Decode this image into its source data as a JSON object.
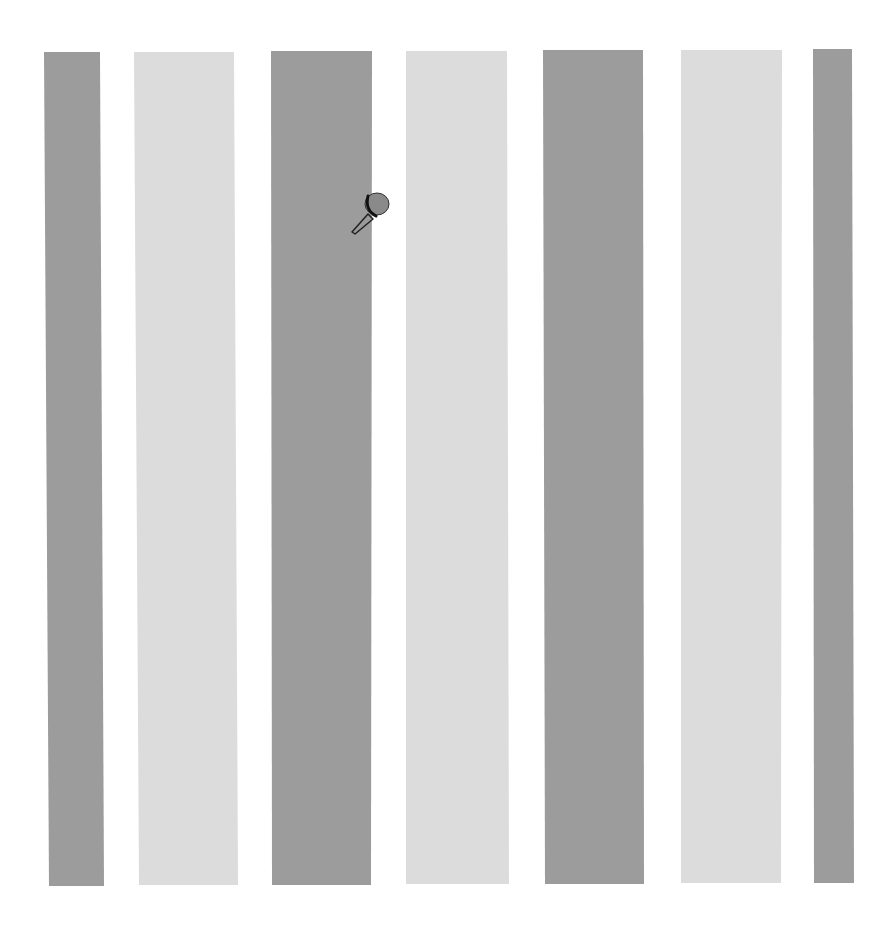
{
  "scene": {
    "description": "Vertical alternating gray stripes on white background with a small pushpin",
    "background": "#ffffff",
    "colors": {
      "dark": "#9c9c9c",
      "light": "#dcdcdc",
      "pin": "#8a8a8a",
      "pin_outline": "#222222"
    },
    "stripes": [
      {
        "tone": "dark",
        "top_left": 44,
        "top_right": 100,
        "bottom_left": 49,
        "bottom_right": 104,
        "top": 52,
        "bottom": 886
      },
      {
        "tone": "light",
        "top_left": 134,
        "top_right": 234,
        "bottom_left": 139,
        "bottom_right": 238,
        "top": 52,
        "bottom": 885
      },
      {
        "tone": "dark",
        "top_left": 271,
        "top_right": 372,
        "bottom_left": 272,
        "bottom_right": 371,
        "top": 51,
        "bottom": 885
      },
      {
        "tone": "light",
        "top_left": 406,
        "top_right": 507,
        "bottom_left": 406,
        "bottom_right": 509,
        "top": 51,
        "bottom": 884
      },
      {
        "tone": "dark",
        "top_left": 543,
        "top_right": 643,
        "bottom_left": 545,
        "bottom_right": 644,
        "top": 50,
        "bottom": 884
      },
      {
        "tone": "light",
        "top_left": 681,
        "top_right": 782,
        "bottom_left": 681,
        "bottom_right": 781,
        "top": 50,
        "bottom": 883
      },
      {
        "tone": "dark",
        "top_left": 813,
        "top_right": 852,
        "bottom_left": 814,
        "bottom_right": 854,
        "top": 49,
        "bottom": 883
      }
    ],
    "pin": {
      "name": "pushpin",
      "x": 370,
      "y": 205
    }
  }
}
